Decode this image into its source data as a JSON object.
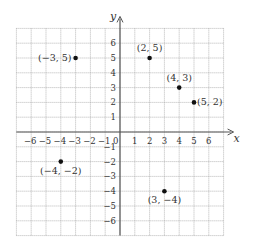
{
  "graph": {
    "x_axis_label": "x",
    "y_axis_label": "y",
    "origin_label": "0",
    "x_range": [
      -7,
      7
    ],
    "y_range": [
      -7,
      7
    ],
    "x_ticks": [
      -6,
      -5,
      -4,
      -3,
      -2,
      -1,
      1,
      2,
      3,
      4,
      5,
      6
    ],
    "y_ticks": [
      -6,
      -5,
      -4,
      -3,
      -2,
      -1,
      1,
      2,
      3,
      4,
      5,
      6
    ],
    "colors": {
      "grid": "#9a9a9a",
      "axis": "#555555",
      "point": "#111111",
      "text": "#333333"
    }
  },
  "points": [
    {
      "x": -3,
      "y": 5,
      "label": "(−3, 5)"
    },
    {
      "x": 2,
      "y": 5,
      "label": "(2, 5)"
    },
    {
      "x": 4,
      "y": 3,
      "label": "(4, 3)"
    },
    {
      "x": 5,
      "y": 2,
      "label": "(5, 2)"
    },
    {
      "x": -4,
      "y": -2,
      "label": "(−4, −2)"
    },
    {
      "x": 3,
      "y": -4,
      "label": "(3, −4)"
    }
  ],
  "chart_data": {
    "type": "scatter",
    "title": "",
    "xlabel": "x",
    "ylabel": "y",
    "xlim": [
      -7,
      7
    ],
    "ylim": [
      -7,
      7
    ],
    "grid": true,
    "x_tick_labels": [
      "-6",
      "-5",
      "-4",
      "-3",
      "-2",
      "-1",
      "0",
      "1",
      "2",
      "3",
      "4",
      "5",
      "6"
    ],
    "y_tick_labels": [
      "-6",
      "-5",
      "-4",
      "-3",
      "-2",
      "-1",
      "1",
      "2",
      "3",
      "4",
      "5",
      "6"
    ],
    "series": [
      {
        "name": "points",
        "x": [
          -3,
          2,
          4,
          5,
          -4,
          3
        ],
        "y": [
          5,
          5,
          3,
          2,
          -2,
          -4
        ],
        "labels": [
          "(−3, 5)",
          "(2, 5)",
          "(4, 3)",
          "(5, 2)",
          "(−4, −2)",
          "(3, −4)"
        ]
      }
    ]
  }
}
